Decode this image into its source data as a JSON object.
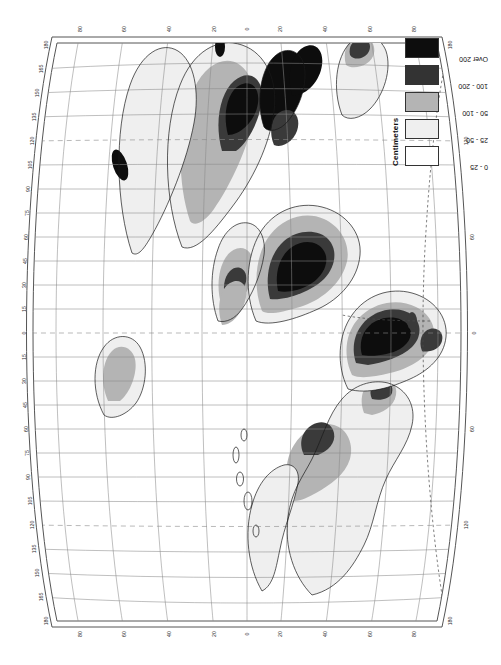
{
  "document": {
    "kind": "printed-map-sheet",
    "projection_note": "pseudo-cylindrical world map with graticule",
    "orientation": "sheet printed sideways; page rotated 90 degrees"
  },
  "legend": {
    "title": "Centimeters",
    "classes": [
      {
        "label": "0 - 25",
        "swatch": "sw0",
        "color": "#ffffff"
      },
      {
        "label": "25 - 50",
        "swatch": "sw1",
        "color": "#efefef"
      },
      {
        "label": "50 - 100",
        "swatch": "sw2",
        "color": "#b4b4b4"
      },
      {
        "label": "100 - 200",
        "swatch": "sw3",
        "color": "#333333"
      },
      {
        "label": "Over 200",
        "swatch": "sw4",
        "color": "#0d0d0d"
      }
    ]
  },
  "graticule": {
    "longitude_labels": [
      "180",
      "165",
      "150",
      "135",
      "120",
      "105",
      "90",
      "75",
      "60",
      "45",
      "30",
      "15",
      "0",
      "15",
      "30",
      "45",
      "60",
      "75",
      "90",
      "105",
      "120",
      "135",
      "150",
      "165",
      "180"
    ],
    "latitude_labels": [
      "80",
      "60",
      "40",
      "20",
      "0",
      "20",
      "40",
      "60",
      "80"
    ],
    "meridian_interval_deg": 15,
    "parallel_interval_deg": 20,
    "prime_meridian_label": "0",
    "dashed_meridians": [
      "120 W",
      "0",
      "120 E"
    ]
  },
  "margin_note": "Copyright by the University of Chicago",
  "colors": {
    "paper": "#ffffff",
    "graticule": "#8a8a8a",
    "coastline": "#1a1a1a",
    "neatline": "#555555"
  }
}
